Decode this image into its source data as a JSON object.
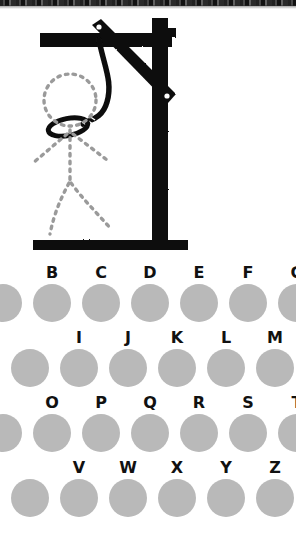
{
  "game": {
    "title": "Hangman",
    "illustration": {
      "name": "gallows-with-dotted-stick-figure",
      "ink_color": "#111111",
      "figure_color": "#9a9a9a",
      "parts": [
        "top-beam",
        "diagonal-brace",
        "vertical-post",
        "base-plate",
        "rope",
        "noose-loop",
        "figure-head",
        "figure-body",
        "figure-left-arm",
        "figure-right-arm",
        "figure-left-leg",
        "figure-right-leg"
      ]
    },
    "wrong_guesses": 0
  },
  "keyboard": {
    "disc_color": "#b9b9b9",
    "label_color": "#111111",
    "rows": [
      {
        "indent": 0,
        "keys": [
          {
            "letter": "A",
            "clipped": true
          },
          {
            "letter": "B",
            "clipped": false
          },
          {
            "letter": "C",
            "clipped": false
          },
          {
            "letter": "D",
            "clipped": false
          },
          {
            "letter": "E",
            "clipped": false
          },
          {
            "letter": "F",
            "clipped": false
          },
          {
            "letter": "G",
            "clipped": false
          }
        ]
      },
      {
        "indent": 27,
        "keys": [
          {
            "letter": "H",
            "clipped": true
          },
          {
            "letter": "I",
            "clipped": false
          },
          {
            "letter": "J",
            "clipped": false
          },
          {
            "letter": "K",
            "clipped": false
          },
          {
            "letter": "L",
            "clipped": false
          },
          {
            "letter": "M",
            "clipped": false
          }
        ]
      },
      {
        "indent": 0,
        "keys": [
          {
            "letter": "N",
            "clipped": true
          },
          {
            "letter": "O",
            "clipped": false
          },
          {
            "letter": "P",
            "clipped": false
          },
          {
            "letter": "Q",
            "clipped": false
          },
          {
            "letter": "R",
            "clipped": false
          },
          {
            "letter": "S",
            "clipped": false
          },
          {
            "letter": "T",
            "clipped": false
          }
        ]
      },
      {
        "indent": 27,
        "keys": [
          {
            "letter": "U",
            "clipped": true
          },
          {
            "letter": "V",
            "clipped": false
          },
          {
            "letter": "W",
            "clipped": false
          },
          {
            "letter": "X",
            "clipped": false
          },
          {
            "letter": "Y",
            "clipped": false
          },
          {
            "letter": "Z",
            "clipped": false
          }
        ]
      }
    ]
  }
}
